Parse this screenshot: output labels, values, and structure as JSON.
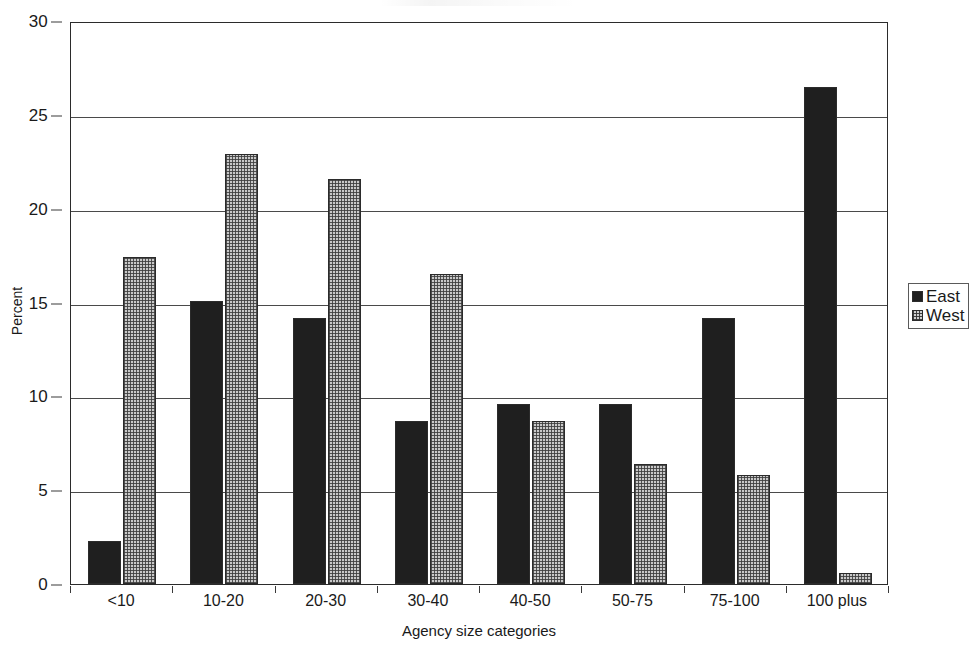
{
  "chart_data": {
    "type": "bar",
    "title": "",
    "xlabel": "Agency size categories",
    "ylabel": "Percent",
    "ylim": [
      0,
      30
    ],
    "ytick_step": 5,
    "yticks": [
      "0",
      "5",
      "10",
      "15",
      "20",
      "25",
      "30"
    ],
    "grid": "horizontal",
    "legend_position": "right",
    "categories": [
      "<10",
      "10-20",
      "20-30",
      "30-40",
      "40-50",
      "50-75",
      "75-100",
      "100 plus"
    ],
    "series": [
      {
        "name": "East",
        "color": "#1f1f1f",
        "pattern": "solid-black",
        "values": [
          2.3,
          15.1,
          14.2,
          8.7,
          9.6,
          9.6,
          14.2,
          26.5
        ]
      },
      {
        "name": "West",
        "color": "#c9c9c9",
        "pattern": "dotted-stipple",
        "values": [
          17.4,
          22.9,
          21.6,
          16.5,
          8.7,
          6.4,
          5.8,
          0.6
        ]
      }
    ]
  },
  "legend": {
    "items": [
      {
        "label": "East",
        "swatch": "east"
      },
      {
        "label": "West",
        "swatch": "west"
      }
    ]
  },
  "axes": {
    "y_title": "Percent",
    "x_title": "Agency size categories"
  }
}
